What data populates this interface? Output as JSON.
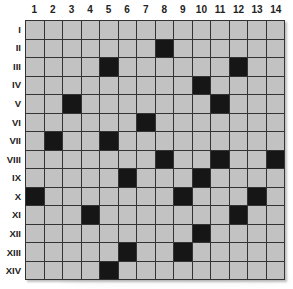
{
  "grid": {
    "columns": [
      "1",
      "2",
      "3",
      "4",
      "5",
      "6",
      "7",
      "8",
      "9",
      "10",
      "11",
      "12",
      "13",
      "14"
    ],
    "rows": [
      "I",
      "II",
      "III",
      "IV",
      "V",
      "VI",
      "VII",
      "VIII",
      "IX",
      "X",
      "XI",
      "XII",
      "XIII",
      "XIV"
    ],
    "colors": {
      "empty": "#c2c2c2",
      "filled": "#161616",
      "lines": "#333333"
    },
    "filled_cells": {
      "I": [],
      "II": [
        8
      ],
      "III": [
        5,
        12
      ],
      "IV": [
        10
      ],
      "V": [
        3,
        11
      ],
      "VI": [
        7
      ],
      "VII": [
        2,
        5
      ],
      "VIII": [
        8,
        11,
        14
      ],
      "IX": [
        6,
        10
      ],
      "X": [
        1,
        9,
        13
      ],
      "XI": [
        4,
        12
      ],
      "XII": [
        10
      ],
      "XIII": [
        6,
        9
      ],
      "XIV": [
        5
      ]
    }
  }
}
